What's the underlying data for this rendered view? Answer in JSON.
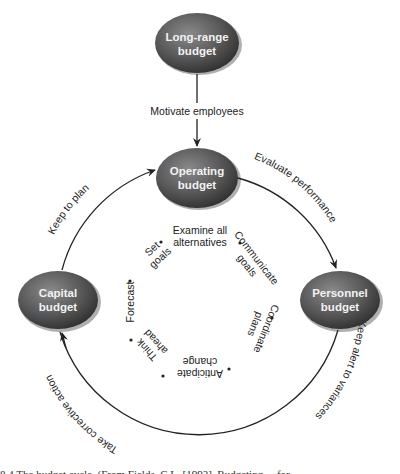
{
  "diagram": {
    "nodes": {
      "long_range": {
        "line1": "Long-range",
        "line2": "budget"
      },
      "operating": {
        "line1": "Operating",
        "line2": "budget"
      },
      "personnel": {
        "line1": "Personnel",
        "line2": "budget"
      },
      "capital": {
        "line1": "Capital",
        "line2": "budget"
      }
    },
    "flows": {
      "motivate": "Motivate employees",
      "evaluate": "Evaluate performance",
      "keep_alert": "Keep alert to variances",
      "corrective": "Take corrective action",
      "keep_plan": "Keep to plan"
    },
    "inner_cycle": [
      {
        "line1": "Examine all",
        "line2": "alternatives"
      },
      {
        "line1": "Communicate",
        "line2": "goals"
      },
      {
        "line1": "Coordinate",
        "line2": "plans"
      },
      {
        "line1": "Anticipate",
        "line2": "change"
      },
      {
        "line1": "Think",
        "line2": "ahead"
      },
      {
        "line1": "Forecast",
        "line2": ""
      },
      {
        "line1": "Set",
        "line2": "goals"
      }
    ],
    "colors": {
      "node_fill": "#555555",
      "node_text": "#f2f2f2",
      "line": "#222222"
    }
  },
  "caption": "8.4 The budget cycle. (From Fields, C.L. [1993]. Budgeting ... for ..."
}
